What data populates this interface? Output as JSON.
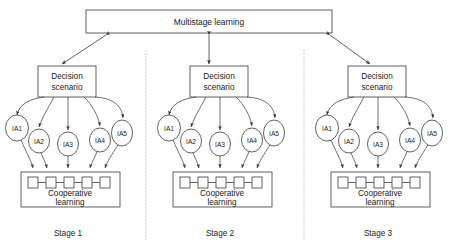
{
  "figure": {
    "type": "block-diagram",
    "title_box": {
      "label": "Multistage learning"
    },
    "stages": [
      {
        "id": "stage-1",
        "caption": "Stage 1",
        "decision_box": {
          "line1": "Decision",
          "line2": "scenario"
        },
        "agents": [
          {
            "label": "IA1"
          },
          {
            "label": "IA2"
          },
          {
            "label": "IA3"
          },
          {
            "label": "IA4"
          },
          {
            "label": "IA5"
          }
        ],
        "cooperative_box": {
          "line1": "Cooperative",
          "line2": "learning",
          "node_count": 5
        }
      },
      {
        "id": "stage-2",
        "caption": "Stage 2",
        "decision_box": {
          "line1": "Decision",
          "line2": "scenario"
        },
        "agents": [
          {
            "label": "IA1"
          },
          {
            "label": "IA2"
          },
          {
            "label": "IA3"
          },
          {
            "label": "IA4"
          },
          {
            "label": "IA5"
          }
        ],
        "cooperative_box": {
          "line1": "Cooperative",
          "line2": "learning",
          "node_count": 5
        }
      },
      {
        "id": "stage-3",
        "caption": "Stage 3",
        "decision_box": {
          "line1": "Decision",
          "line2": "scenario"
        },
        "agents": [
          {
            "label": "IA1"
          },
          {
            "label": "IA2"
          },
          {
            "label": "IA3"
          },
          {
            "label": "IA4"
          },
          {
            "label": "IA5"
          }
        ],
        "cooperative_box": {
          "line1": "Cooperative",
          "line2": "learning",
          "node_count": 5
        }
      }
    ],
    "connectors": {
      "title_to_stage1": "double-arrow-diagonal-left",
      "title_to_stage2": "double-arrow-vertical",
      "title_to_stage3": "double-arrow-diagonal-right"
    },
    "colors": {
      "stroke": "#3a3a3a",
      "curve": "#4a4a4a",
      "divider": "#b5b5b5",
      "text": "#1a1a1a",
      "background": "#ffffff"
    }
  }
}
